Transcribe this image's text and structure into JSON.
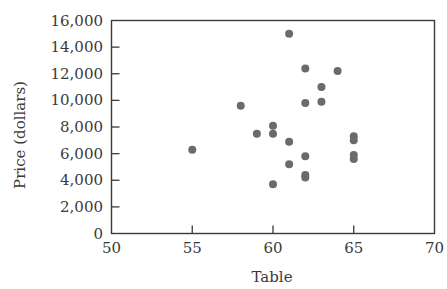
{
  "chart_data": {
    "type": "scatter",
    "title": "",
    "xlabel": "Table",
    "ylabel": "Price (dollars)",
    "xlim": [
      50,
      70
    ],
    "ylim": [
      0,
      16000
    ],
    "x_ticks": [
      50,
      55,
      60,
      65,
      70
    ],
    "x_tick_labels": [
      "50",
      "55",
      "60",
      "65",
      "70"
    ],
    "y_ticks": [
      0,
      2000,
      4000,
      6000,
      8000,
      10000,
      12000,
      14000,
      16000
    ],
    "y_tick_labels": [
      "0",
      "2,000",
      "4,000",
      "6,000",
      "8,000",
      "10,000",
      "12,000",
      "14,000",
      "16,000"
    ],
    "grid": false,
    "legend": null,
    "series": [
      {
        "name": "Diamonds",
        "color": "#6b6b6b",
        "points": [
          {
            "x": 55,
            "y": 6300
          },
          {
            "x": 58,
            "y": 9600
          },
          {
            "x": 59,
            "y": 7500
          },
          {
            "x": 60,
            "y": 8100
          },
          {
            "x": 60,
            "y": 7500
          },
          {
            "x": 60,
            "y": 3700
          },
          {
            "x": 61,
            "y": 15000
          },
          {
            "x": 61,
            "y": 6900
          },
          {
            "x": 61,
            "y": 5200
          },
          {
            "x": 62,
            "y": 12400
          },
          {
            "x": 62,
            "y": 9800
          },
          {
            "x": 62,
            "y": 5800
          },
          {
            "x": 62,
            "y": 4400
          },
          {
            "x": 62,
            "y": 4200
          },
          {
            "x": 63,
            "y": 11000
          },
          {
            "x": 63,
            "y": 9900
          },
          {
            "x": 64,
            "y": 12200
          },
          {
            "x": 65,
            "y": 7300
          },
          {
            "x": 65,
            "y": 7000
          },
          {
            "x": 65,
            "y": 5900
          },
          {
            "x": 65,
            "y": 5600
          }
        ]
      }
    ]
  },
  "colors": {
    "axis": "#3a3a3a",
    "marker": "#6b6b6b",
    "background": "#ffffff"
  }
}
